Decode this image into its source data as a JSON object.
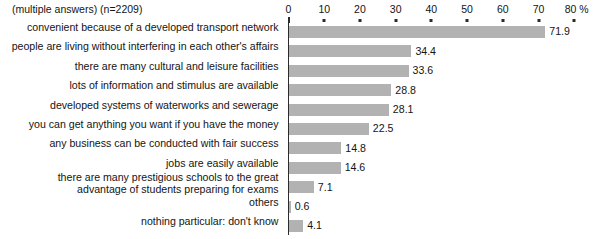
{
  "note": "(multiple answers) (n=2209)",
  "axis": {
    "unit_suffix": "%",
    "tick_labels": [
      "0",
      "10",
      "20",
      "30",
      "40",
      "50",
      "60",
      "70",
      "80 %"
    ],
    "ticks": [
      0,
      10,
      20,
      30,
      40,
      50,
      60,
      70,
      80
    ]
  },
  "colors": {
    "bar": "#b2b2b2",
    "axis": "#2b2b2b",
    "text": "#141414"
  },
  "chart_data": {
    "type": "bar",
    "orientation": "horizontal",
    "title": "",
    "subtitle": "(multiple answers) (n=2209)",
    "xlabel": "%",
    "ylabel": "",
    "xlim": [
      0,
      80
    ],
    "grid": false,
    "legend": "none",
    "sample_size": 2209,
    "categories": [
      "convenient because of a developed transport network",
      "people are living without interfering in each other's affairs",
      "there are many cultural and leisure facilities",
      "lots of information and stimulus are available",
      "developed systems of waterworks and sewerage",
      "you can get anything you want if you have the money",
      "any business can be conducted with fair success",
      "jobs are easily available",
      "there are many prestigious schools to the great\nadvantage of students preparing for exams",
      "others",
      "nothing particular: don't know"
    ],
    "values": [
      71.9,
      34.4,
      33.6,
      28.8,
      28.1,
      22.5,
      14.8,
      14.6,
      7.1,
      0.6,
      4.1
    ],
    "value_labels": [
      "71.9",
      "34.4",
      "33.6",
      "28.8",
      "28.1",
      "22.5",
      "14.8",
      "14.6",
      "7.1",
      "0.6",
      "4.1"
    ]
  }
}
